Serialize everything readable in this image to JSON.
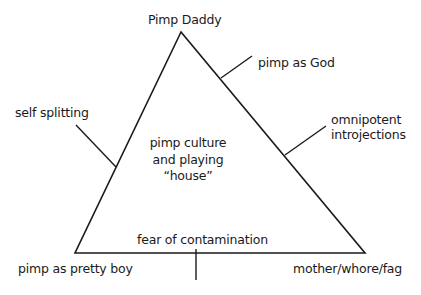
{
  "diagram": {
    "type": "triangle-concept-map",
    "vertices": {
      "top": "Pimp Daddy",
      "bottom_left": "pimp as pretty boy",
      "bottom_right": "mother/whore/fag"
    },
    "edges": {
      "left": "self splitting",
      "right_upper": "pimp as God",
      "right_lower_line1": "omnipotent",
      "right_lower_line2": "introjections",
      "bottom": "fear of contamination"
    },
    "center": {
      "line1": "pimp culture",
      "line2": "and playing",
      "line3": "“house”"
    },
    "line_color": "#1a1a1a"
  }
}
